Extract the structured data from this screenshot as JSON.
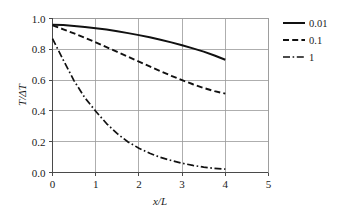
{
  "chart_data": {
    "type": "line",
    "title": "",
    "xlabel": "x/L",
    "ylabel": "T/ΔT",
    "xlim": [
      0,
      5
    ],
    "ylim": [
      0,
      1.0
    ],
    "xticks": [
      "0",
      "1",
      "2",
      "3",
      "4",
      "5"
    ],
    "xtick_values": [
      0,
      1,
      2,
      3,
      4,
      5
    ],
    "yticks": [
      "0.0",
      "0.2",
      "0.4",
      "0.6",
      "0.8",
      "1.0"
    ],
    "ytick_values": [
      0.0,
      0.2,
      0.4,
      0.6,
      0.8,
      1.0
    ],
    "grid": true,
    "legend_position": "right",
    "series": [
      {
        "name": "0.01",
        "style": "solid",
        "color": "#111111",
        "x": [
          0.0,
          0.25,
          0.5,
          0.75,
          1.0,
          1.25,
          1.5,
          1.75,
          2.0,
          2.25,
          2.5,
          2.75,
          3.0,
          3.25,
          3.5,
          3.75,
          4.0
        ],
        "y": [
          0.96,
          0.957,
          0.952,
          0.945,
          0.937,
          0.928,
          0.917,
          0.905,
          0.892,
          0.878,
          0.862,
          0.845,
          0.826,
          0.806,
          0.785,
          0.76,
          0.732
        ]
      },
      {
        "name": "0.1",
        "style": "dashed",
        "color": "#111111",
        "x": [
          0.0,
          0.25,
          0.5,
          0.75,
          1.0,
          1.25,
          1.5,
          1.75,
          2.0,
          2.25,
          2.5,
          2.75,
          3.0,
          3.25,
          3.5,
          3.75,
          4.0
        ],
        "y": [
          0.955,
          0.93,
          0.903,
          0.874,
          0.845,
          0.814,
          0.783,
          0.752,
          0.72,
          0.689,
          0.658,
          0.628,
          0.6,
          0.573,
          0.549,
          0.528,
          0.512
        ]
      },
      {
        "name": "1",
        "style": "dashdot",
        "color": "#111111",
        "x": [
          0.0,
          0.25,
          0.5,
          0.75,
          1.0,
          1.25,
          1.5,
          1.75,
          2.0,
          2.25,
          2.5,
          2.75,
          3.0,
          3.25,
          3.5,
          3.75,
          4.0
        ],
        "y": [
          0.87,
          0.73,
          0.595,
          0.485,
          0.398,
          0.318,
          0.252,
          0.198,
          0.158,
          0.125,
          0.098,
          0.078,
          0.06,
          0.046,
          0.035,
          0.027,
          0.022
        ]
      }
    ]
  },
  "legend": {
    "entries": [
      {
        "label": "0.01",
        "style": "solid"
      },
      {
        "label": "0.1",
        "style": "dashed"
      },
      {
        "label": "1",
        "style": "dashdot"
      }
    ]
  },
  "axes": {
    "x_title": "x/L",
    "y_title": "T/ΔT"
  }
}
